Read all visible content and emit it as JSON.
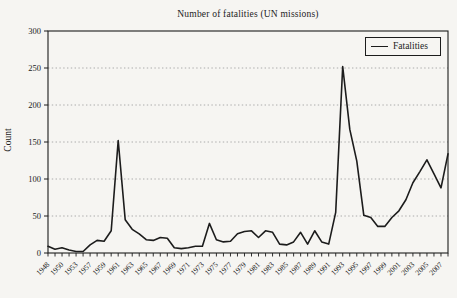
{
  "page": {
    "background": "#f6f5f2"
  },
  "chart": {
    "title": "Number of fatalities (UN missions)",
    "y_axis_title": "Count",
    "legend_label": "Fatalities",
    "line_color": "#1c1c1c",
    "grid_color": "#999999",
    "frame_color": "#1c1c1c"
  },
  "chart_data": {
    "type": "line",
    "title": "Number of fatalities (UN missions)",
    "xlabel": "",
    "ylabel": "Count",
    "legend": [
      "Fatalities"
    ],
    "legend_position": "top-right-inside",
    "grid": "horizontal-dotted",
    "ylim": [
      0,
      300
    ],
    "yticks": [
      0,
      50,
      100,
      150,
      200,
      250,
      300
    ],
    "x": [
      1948,
      1949,
      1950,
      1951,
      1953,
      1956,
      1957,
      1958,
      1959,
      1960,
      1961,
      1962,
      1963,
      1964,
      1965,
      1966,
      1967,
      1968,
      1969,
      1970,
      1971,
      1972,
      1973,
      1974,
      1975,
      1976,
      1977,
      1978,
      1979,
      1980,
      1981,
      1982,
      1983,
      1984,
      1985,
      1986,
      1987,
      1988,
      1989,
      1990,
      1991,
      1992,
      1993,
      1994,
      1995,
      1996,
      1997,
      1998,
      1999,
      2000,
      2001,
      2002,
      2003,
      2004,
      2005,
      2006,
      2007,
      2008
    ],
    "series": [
      {
        "name": "Fatalities",
        "values": [
          9,
          5,
          7,
          4,
          2,
          2,
          11,
          17,
          16,
          30,
          152,
          45,
          32,
          26,
          18,
          17,
          21,
          20,
          7,
          6,
          7,
          9,
          9,
          40,
          18,
          15,
          16,
          26,
          29,
          30,
          21,
          30,
          28,
          12,
          11,
          15,
          28,
          12,
          30,
          15,
          12,
          55,
          252,
          167,
          124,
          51,
          48,
          36,
          36,
          48,
          57,
          72,
          95,
          110,
          126,
          107,
          88,
          134
        ]
      }
    ],
    "xtick_labels": [
      "1948",
      "1950",
      "1953",
      "1957",
      "1959",
      "1961",
      "1963",
      "1965",
      "1967",
      "1969",
      "1971",
      "1973",
      "1975",
      "1977",
      "1979",
      "1981",
      "1983",
      "1985",
      "1987",
      "1989",
      "1991",
      "1993",
      "1995",
      "1997",
      "1999",
      "2001",
      "2003",
      "2005",
      "2007"
    ],
    "xtick_every": 2
  }
}
